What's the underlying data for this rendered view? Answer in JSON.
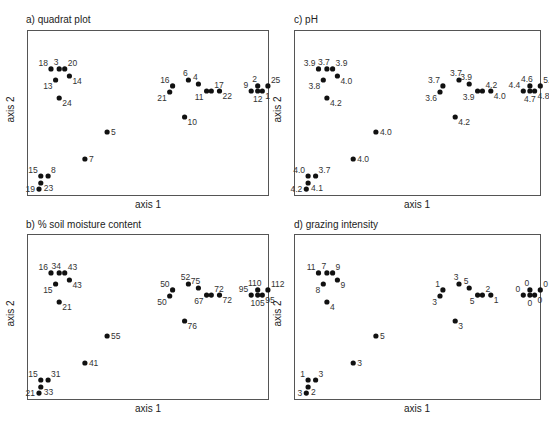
{
  "chart_data": [
    {
      "type": "scatter",
      "id": "a",
      "title": "a) quadrat plot",
      "xlabel": "axis 1",
      "ylabel": "axis 2",
      "grid": false,
      "points": [
        {
          "x": 0.108,
          "y": 0.764,
          "label": "18",
          "pos": "tl"
        },
        {
          "x": 0.145,
          "y": 0.764,
          "label": "3",
          "pos": "t"
        },
        {
          "x": 0.17,
          "y": 0.764,
          "label": "20",
          "pos": "tr"
        },
        {
          "x": 0.191,
          "y": 0.721,
          "label": "14",
          "pos": "br"
        },
        {
          "x": 0.129,
          "y": 0.697,
          "label": "13",
          "pos": "bl"
        },
        {
          "x": 0.145,
          "y": 0.588,
          "label": "24",
          "pos": "br"
        },
        {
          "x": 0.656,
          "y": 0.661,
          "label": "16",
          "pos": "tl"
        },
        {
          "x": 0.643,
          "y": 0.624,
          "label": "21",
          "pos": "bl"
        },
        {
          "x": 0.727,
          "y": 0.697,
          "label": "6",
          "pos": "t"
        },
        {
          "x": 0.772,
          "y": 0.673,
          "label": "4",
          "pos": "t"
        },
        {
          "x": 0.809,
          "y": 0.63,
          "label": "11",
          "pos": "bl"
        },
        {
          "x": 0.83,
          "y": 0.63,
          "label": "17",
          "pos": "tr"
        },
        {
          "x": 0.867,
          "y": 0.63,
          "label": "22",
          "pos": "br"
        },
        {
          "x": 0.71,
          "y": 0.473,
          "label": "10",
          "pos": "br"
        },
        {
          "x": 0.361,
          "y": 0.382,
          "label": "5",
          "pos": "r"
        },
        {
          "x": 0.261,
          "y": 0.218,
          "label": "7",
          "pos": "r"
        },
        {
          "x": 1.01,
          "y": 0.63,
          "label": "9",
          "pos": "tl"
        },
        {
          "x": 1.039,
          "y": 0.661,
          "label": "2",
          "pos": "t"
        },
        {
          "x": 1.039,
          "y": 0.63,
          "label": "12",
          "pos": "b"
        },
        {
          "x": 1.06,
          "y": 0.63,
          "label": "1",
          "pos": "br"
        },
        {
          "x": 1.085,
          "y": 0.661,
          "label": "25",
          "pos": "tr"
        },
        {
          "x": 0.062,
          "y": 0.115,
          "label": "15",
          "pos": "tl"
        },
        {
          "x": 0.095,
          "y": 0.115,
          "label": "8",
          "pos": "tr"
        },
        {
          "x": 0.062,
          "y": 0.073,
          "label": "23",
          "pos": "br"
        },
        {
          "x": 0.054,
          "y": 0.036,
          "label": "19",
          "pos": "l"
        }
      ]
    },
    {
      "type": "scatter",
      "id": "b",
      "title": "b) % soil moisture content",
      "xlabel": "axis 1",
      "ylabel": "axis 2",
      "grid": false,
      "labels": [
        "16",
        "34",
        "43",
        "43",
        "15",
        "21",
        "50",
        "50",
        "52",
        "75",
        "67",
        "72",
        "72",
        "76",
        "55",
        "41",
        "95",
        "110",
        "105",
        "95",
        "112",
        "15",
        "31",
        "33",
        "21"
      ]
    },
    {
      "type": "scatter",
      "id": "c",
      "title": "c) pH",
      "xlabel": "axis 1",
      "ylabel": "axis 2",
      "grid": false,
      "labels": [
        "3.9",
        "3.7",
        "3.9",
        "4.0",
        "3.8",
        "4.2",
        "3.7",
        "3.6",
        "3.7",
        "3.9",
        "3.9",
        "4.2",
        "4.0",
        "4.2",
        "4.0",
        "4.0",
        "4.4",
        "4.6",
        "4.7",
        "4.8",
        "5.2",
        "4.0",
        "3.7",
        "4.1",
        "4.2"
      ]
    },
    {
      "type": "scatter",
      "id": "d",
      "title": "d) grazing intensity",
      "xlabel": "axis 1",
      "ylabel": "axis 2",
      "grid": false,
      "labels": [
        "11",
        "7",
        "9",
        "9",
        "8",
        "4",
        "1",
        "3",
        "3",
        "5",
        "5",
        "2",
        "1",
        "3",
        "5",
        "3",
        "0",
        "0",
        "0",
        "0",
        "0",
        "1",
        "3",
        "2",
        "3"
      ]
    }
  ],
  "panels": {
    "a": {
      "title": "a) quadrat plot",
      "xlabel": "axis 1",
      "ylabel": "axis 2"
    },
    "b": {
      "title": "b) % soil moisture content",
      "xlabel": "axis 1",
      "ylabel": "axis 2"
    },
    "c": {
      "title": "c) pH",
      "xlabel": "axis 1",
      "ylabel": "axis 2"
    },
    "d": {
      "title": "d) grazing intensity",
      "xlabel": "axis 1",
      "ylabel": "axis 2"
    }
  }
}
